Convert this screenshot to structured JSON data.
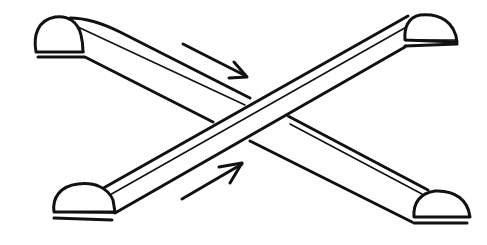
{
  "figure": {
    "style": "black line drawing on white",
    "elements": [
      {
        "name": "escalator-descending",
        "direction": "top-left to bottom-right"
      },
      {
        "name": "escalator-ascending",
        "direction": "bottom-left to top-right"
      },
      {
        "name": "arrow-down-right",
        "meaning": "downward travel"
      },
      {
        "name": "arrow-up-right",
        "meaning": "upward travel"
      }
    ],
    "colors": {
      "stroke": "#111111",
      "background": "#ffffff"
    }
  }
}
